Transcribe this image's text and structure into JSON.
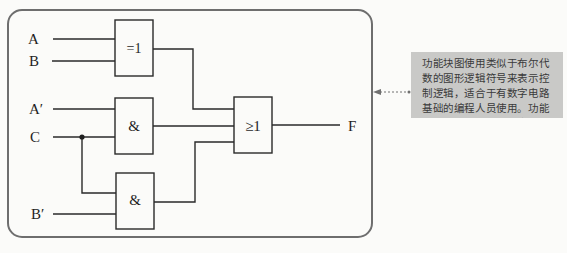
{
  "diagram": {
    "type": "function-block-diagram",
    "inputs": [
      {
        "id": "A",
        "label": "A"
      },
      {
        "id": "B",
        "label": "B"
      },
      {
        "id": "A_prime",
        "label": "A′"
      },
      {
        "id": "C",
        "label": "C"
      },
      {
        "id": "B_prime",
        "label": "B′"
      }
    ],
    "gates": [
      {
        "id": "xor",
        "symbol": "=1",
        "inputs": [
          "A",
          "B"
        ]
      },
      {
        "id": "and1",
        "symbol": "&",
        "inputs": [
          "A′",
          "C"
        ]
      },
      {
        "id": "and2",
        "symbol": "&",
        "inputs": [
          "C",
          "B′"
        ]
      },
      {
        "id": "or",
        "symbol": "≥1",
        "inputs": [
          "xor",
          "and1",
          "and2"
        ]
      }
    ],
    "output": {
      "id": "F",
      "label": "F"
    },
    "callout": {
      "text": "功能块图使用类似于布尔代数的图形逻辑符号来表示控制逻辑，适合于有数字电路基础的编程人员使用。功能块图适合于过程控制应用。"
    },
    "colors": {
      "line": "#2a2a2a",
      "frame": "#6e6e6e",
      "callout_bg": "#c9c9c7",
      "callout_arrow": "#707070"
    }
  }
}
